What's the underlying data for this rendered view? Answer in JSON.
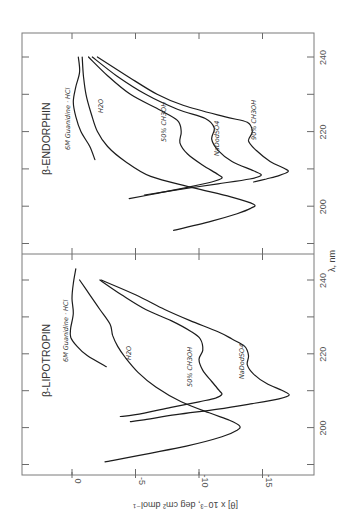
{
  "chart_data": [
    {
      "type": "line",
      "title": "β-ENDORPHIN",
      "xlabel": "λ, nm",
      "ylabel": "[θ] x 10⁻³, deg cm² dmol⁻¹",
      "xlim": [
        187,
        246
      ],
      "ylim": [
        2.5,
        -19
      ],
      "xticks": [
        190,
        200,
        210,
        220,
        230,
        240
      ],
      "xtick_labels": [
        "200",
        "220",
        "240"
      ],
      "yticks": [
        0,
        -5,
        -10,
        -15
      ],
      "grid": false,
      "orientation": "rotated 90° counter-clockwise (wavelength runs vertically, θ horizontally)",
      "series": [
        {
          "name": "6M Guanidine · HCl",
          "points": [
            [
              240,
              -0.5
            ],
            [
              236,
              -0.6
            ],
            [
              232,
              -0.3
            ],
            [
              228,
              -0.1
            ],
            [
              224,
              -0.3
            ],
            [
              220,
              -0.7
            ],
            [
              216,
              -1.4
            ],
            [
              212.5,
              -1.8
            ]
          ]
        },
        {
          "name": "H2O",
          "points": [
            [
              240,
              -0.8
            ],
            [
              235,
              -0.9
            ],
            [
              230,
              -1.1
            ],
            [
              225,
              -1.5
            ],
            [
              220,
              -2.0
            ],
            [
              216,
              -2.8
            ],
            [
              212,
              -4.2
            ],
            [
              208,
              -6.2
            ],
            [
              205,
              -9.5
            ],
            [
              202.5,
              -12.5
            ],
            [
              200.5,
              -14.3
            ],
            [
              199.5,
              -14.1
            ],
            [
              198,
              -13.0
            ],
            [
              196,
              -11.0
            ],
            [
              193.5,
              -8.0
            ]
          ]
        },
        {
          "name": "50% CH3OH",
          "points": [
            [
              240,
              -1.3
            ],
            [
              235,
              -2.8
            ],
            [
              230,
              -4.6
            ],
            [
              226,
              -6.8
            ],
            [
              223,
              -8.3
            ],
            [
              220,
              -8.6
            ],
            [
              217,
              -8.5
            ],
            [
              214,
              -9.1
            ],
            [
              211,
              -10.3
            ],
            [
              208.5,
              -11.5
            ],
            [
              207.5,
              -11.8
            ],
            [
              206.5,
              -11.0
            ],
            [
              205,
              -9.0
            ],
            [
              203.5,
              -6.8
            ],
            [
              202,
              -4.5
            ]
          ]
        },
        {
          "name": "NaDodSO4",
          "points": [
            [
              240,
              -1.6
            ],
            [
              235,
              -3.5
            ],
            [
              230,
              -5.8
            ],
            [
              226,
              -8.3
            ],
            [
              223.5,
              -10.5
            ],
            [
              221,
              -11.2
            ],
            [
              218,
              -11.0
            ],
            [
              215,
              -11.5
            ],
            [
              212,
              -12.6
            ],
            [
              209.5,
              -14.3
            ],
            [
              208.3,
              -14.9
            ],
            [
              207.3,
              -14.0
            ],
            [
              206,
              -11.5
            ],
            [
              204.5,
              -8.5
            ],
            [
              203,
              -5.7
            ]
          ]
        },
        {
          "name": "90% CH3OH",
          "points": [
            [
              240,
              -2.0
            ],
            [
              235,
              -4.3
            ],
            [
              230,
              -6.7
            ],
            [
              227,
              -8.8
            ],
            [
              224,
              -12.0
            ],
            [
              222.5,
              -13.8
            ],
            [
              220,
              -14.2
            ],
            [
              217.5,
              -13.9
            ],
            [
              215,
              -14.5
            ],
            [
              212,
              -15.6
            ],
            [
              210,
              -16.8
            ],
            [
              209.2,
              -17.0
            ],
            [
              208.2,
              -16.3
            ],
            [
              207.3,
              -15.3
            ],
            [
              206.5,
              -14.3
            ]
          ]
        }
      ]
    },
    {
      "type": "line",
      "title": "β-LIPOTROPIN",
      "xlabel": "λ, nm",
      "ylabel": "[θ] x 10⁻³, deg cm² dmol⁻¹",
      "xlim": [
        187,
        246
      ],
      "ylim": [
        2.5,
        -19
      ],
      "xticks": [
        190,
        200,
        210,
        220,
        230,
        240
      ],
      "xtick_labels": [
        "200",
        "220",
        "240"
      ],
      "yticks": [
        0,
        -5,
        -10,
        -15
      ],
      "ytick_labels": [
        "0",
        "-5",
        "-10",
        "-15"
      ],
      "grid": false,
      "series": [
        {
          "name": "6M Guanidine · HCl",
          "points": [
            [
              243,
              -0.3
            ],
            [
              239,
              -0.1
            ],
            [
              235,
              0.0
            ],
            [
              231,
              -0.1
            ],
            [
              227,
              0.1
            ],
            [
              224.5,
              0.1
            ],
            [
              222,
              -0.4
            ],
            [
              219.5,
              -1.2
            ],
            [
              216.5,
              -2.7
            ]
          ]
        },
        {
          "name": "H2O",
          "points": [
            [
              240,
              -0.6
            ],
            [
              236,
              -1.4
            ],
            [
              232,
              -2.2
            ],
            [
              228,
              -3.0
            ],
            [
              225,
              -3.2
            ],
            [
              222,
              -3.6
            ],
            [
              219,
              -4.2
            ],
            [
              215,
              -5.2
            ],
            [
              211,
              -6.6
            ],
            [
              207,
              -8.6
            ],
            [
              204,
              -10.8
            ],
            [
              202,
              -12.4
            ],
            [
              200.5,
              -13.2
            ],
            [
              199.3,
              -13.0
            ],
            [
              197.5,
              -11.8
            ],
            [
              195,
              -9.0
            ],
            [
              190.7,
              -2.6
            ]
          ]
        },
        {
          "name": "50% CH3OH",
          "points": [
            [
              240,
              -2.2
            ],
            [
              236,
              -3.9
            ],
            [
              232,
              -5.8
            ],
            [
              229,
              -7.8
            ],
            [
              226,
              -9.4
            ],
            [
              224,
              -10.1
            ],
            [
              221,
              -10.3
            ],
            [
              218.5,
              -10.0
            ],
            [
              215.5,
              -10.3
            ],
            [
              212.5,
              -11.0
            ],
            [
              210,
              -11.6
            ],
            [
              209,
              -11.8
            ],
            [
              208,
              -11.3
            ],
            [
              207,
              -10.0
            ],
            [
              205.5,
              -7.8
            ],
            [
              203.5,
              -5.0
            ],
            [
              203,
              -3.8
            ]
          ]
        },
        {
          "name": "NaDodSO4",
          "points": [
            [
              240,
              -2.3
            ],
            [
              236,
              -5.0
            ],
            [
              232,
              -7.3
            ],
            [
              229,
              -9.3
            ],
            [
              226,
              -11.5
            ],
            [
              224,
              -12.6
            ],
            [
              222,
              -13.6
            ],
            [
              219.5,
              -13.9
            ],
            [
              217,
              -13.8
            ],
            [
              214.5,
              -14.3
            ],
            [
              212,
              -15.3
            ],
            [
              210,
              -16.6
            ],
            [
              208.8,
              -17.1
            ],
            [
              207.8,
              -16.3
            ],
            [
              206.5,
              -14.2
            ],
            [
              205,
              -11.5
            ],
            [
              203.5,
              -8.2
            ],
            [
              202,
              -5.5
            ],
            [
              201.6,
              -4.6
            ]
          ]
        }
      ]
    }
  ],
  "figure": {
    "shared_xlabel": "λ, nm",
    "shared_ylabel": "[θ] x 10⁻³, deg cm² dmol⁻¹",
    "top_panel_title": "β-ENDORPHIN",
    "bottom_panel_title": "β-LIPOTROPIN",
    "wavelength_tick_labels": [
      "200",
      "220",
      "240"
    ],
    "theta_tick_labels": [
      "0",
      "-5",
      "-10",
      "-15"
    ],
    "series_labels_top": [
      "6M Guanidine · HCl",
      "H2O",
      "50% CH3OH",
      "NaDodSO4",
      "90% CH3OH"
    ],
    "series_labels_bottom": [
      "6M Guanidine · HCl",
      "H2O",
      "50% CH3OH",
      "NaDodSO4"
    ],
    "line_color": "#1c1c1c",
    "frame_color": "#7a7a7a"
  }
}
